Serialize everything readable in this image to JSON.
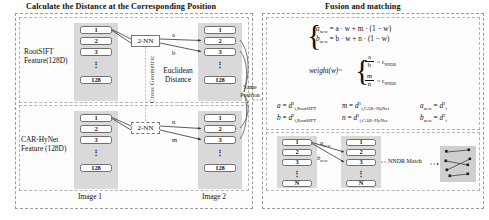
{
  "panels": {
    "left": {
      "title": "Calculate the Distance at the Corresponding Position"
    },
    "right": {
      "title": "Fusion and matching"
    }
  },
  "left_panel": {
    "rows": [
      {
        "feature_label_line1": "RootSIFT",
        "feature_label_line2": "Feature(128D)",
        "nn_label": "2-NN",
        "arrow_labels": [
          "a",
          "b"
        ]
      },
      {
        "feature_label_line1": "CAR-HyNet",
        "feature_label_line2": "Feature (128D)",
        "nn_label": "2-NN",
        "arrow_labels": [
          "n",
          "m"
        ]
      }
    ],
    "column_cells": [
      "1",
      "2",
      "3",
      "128"
    ],
    "vertical_dots": "⋮",
    "cross_geometric_label": "Cross Geometric",
    "euclidean_label_line1": "Euclidean",
    "euclidean_label_line2": "Distance",
    "same_position_line1": "Same",
    "same_position_line2": "Position",
    "image1_caption": "Image 1",
    "image2_caption": "Image 2"
  },
  "right_panel": {
    "system1": {
      "line1_lhs": "a",
      "line1_lhs_sub": "new",
      "line1_rhs": "= a · w + m · (1 − w)",
      "line2_lhs": "b",
      "line2_lhs_sub": "new",
      "line2_rhs": "= b · w + n · (1 − w)"
    },
    "weight": {
      "label": "weight(w)~",
      "frac1_num": "a",
      "frac1_den": "b",
      "frac1_rel": "~ r",
      "frac1_rel_sub": "NNDR",
      "frac2_num": "m",
      "frac2_den": "n",
      "frac2_rel": "~ r",
      "frac2_rel_sub": "NNDR"
    },
    "definitions": [
      {
        "lhs": "a",
        "eq": "=",
        "d": "d",
        "sup": "1",
        "sub": "i,RootSIFT"
      },
      {
        "lhs": "b",
        "eq": "=",
        "d": "d",
        "sup": "2",
        "sub": "i,RootSIFT"
      },
      {
        "lhs": "m",
        "eq": "=",
        "d": "d",
        "sup": "1",
        "sub": "i,CAR−HyNet"
      },
      {
        "lhs": "n",
        "eq": "=",
        "d": "d",
        "sup": "1",
        "sub": "i,CAR−HyNet"
      },
      {
        "lhs": "a",
        "lhs_sub": "new",
        "eq": "=",
        "d": "d",
        "sup": "1",
        "sub": "i"
      },
      {
        "lhs": "b",
        "lhs_sub": "new",
        "eq": "=",
        "d": "d",
        "sup": "2",
        "sub": "i"
      }
    ],
    "match_section": {
      "column_cells": [
        "1",
        "2",
        "3",
        "N"
      ],
      "vertical_dots": "⋮",
      "arrow_label_a": "a",
      "arrow_label_a_sub": "new",
      "arrow_label_b": "b",
      "arrow_label_b_sub": "new",
      "nndr_match_label": "NNDR Match"
    }
  },
  "colors": {
    "panel_border": "#9a9a9a",
    "column_fill": "#d9d9d9",
    "cell_fill": "#ffffff",
    "cell_stroke": "#6f6f6f",
    "match_box_fill": "#cfcfcf",
    "arrow": "#333333",
    "text": "#111111"
  }
}
